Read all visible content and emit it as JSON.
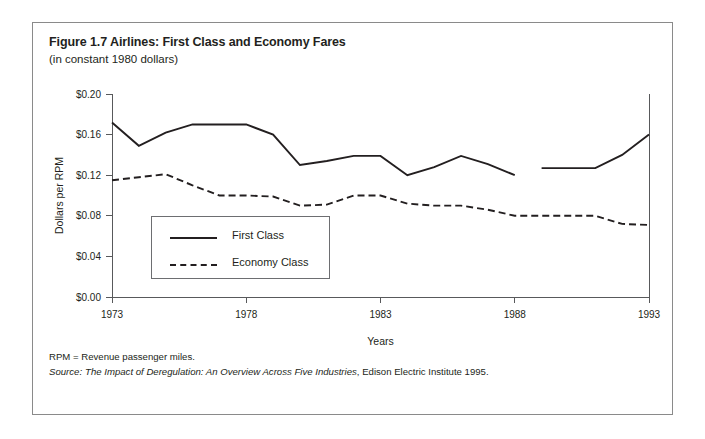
{
  "figure": {
    "title": "Figure 1.7 Airlines: First Class and Economy Fares",
    "subtitle": "(in constant 1980 dollars)",
    "note": "RPM = Revenue passenger miles.",
    "source_label": "Source:",
    "source_italic": "The Impact of Deregulation: An Overview Across Five Industries",
    "source_rest": ", Edison Electric Institute 1995."
  },
  "legend": {
    "items": [
      {
        "label": "First Class",
        "style": "solid"
      },
      {
        "label": "Economy Class",
        "style": "dashed"
      }
    ]
  },
  "chart_data": {
    "type": "line",
    "title": "Figure 1.7 Airlines: First Class and Economy Fares",
    "subtitle": "(in constant 1980 dollars)",
    "xlabel": "Years",
    "ylabel": "Dollars per RPM",
    "xlim": [
      1973,
      1993
    ],
    "ylim": [
      0.0,
      0.2
    ],
    "xticks": [
      1973,
      1978,
      1983,
      1988,
      1993
    ],
    "xtick_labels": [
      "1973",
      "1978",
      "1983",
      "1988",
      "1993"
    ],
    "yticks": [
      0.0,
      0.04,
      0.08,
      0.12,
      0.16,
      0.2
    ],
    "ytick_labels": [
      "$0.00",
      "$0.04",
      "$0.08",
      "$0.12",
      "$0.16",
      "$0.20"
    ],
    "grid": false,
    "legend_position": "inside-lower-left",
    "x": [
      1973,
      1974,
      1975,
      1976,
      1977,
      1978,
      1979,
      1980,
      1981,
      1982,
      1983,
      1984,
      1985,
      1986,
      1987,
      1988,
      1989,
      1990,
      1991,
      1992,
      1993
    ],
    "series": [
      {
        "name": "First Class",
        "style": "solid",
        "values": [
          0.172,
          0.149,
          0.162,
          0.17,
          0.17,
          0.17,
          0.16,
          0.13,
          0.134,
          0.139,
          0.139,
          0.12,
          0.128,
          0.139,
          0.131,
          0.12,
          0.127,
          0.127,
          0.127,
          0.14,
          0.16
        ],
        "gap_after_year": 1988
      },
      {
        "name": "Economy Class",
        "style": "dashed",
        "values": [
          0.115,
          0.118,
          0.121,
          0.11,
          0.1,
          0.1,
          0.099,
          0.09,
          0.091,
          0.1,
          0.1,
          0.092,
          0.09,
          0.09,
          0.086,
          0.08,
          0.08,
          0.08,
          0.08,
          0.072,
          0.071
        ]
      }
    ]
  }
}
